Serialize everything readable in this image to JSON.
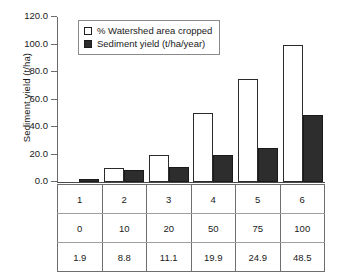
{
  "chart_data": {
    "type": "bar",
    "title": "",
    "xlabel": "",
    "ylabel": "Sediment yield (t/ha)",
    "ylim": [
      0,
      120
    ],
    "yticks": [
      "0.0",
      "20.0",
      "40.0",
      "60.0",
      "80.0",
      "100.0",
      "120.0"
    ],
    "ytick_values": [
      0,
      20,
      40,
      60,
      80,
      100,
      120
    ],
    "grid": false,
    "legend_position": "upper-left-inside",
    "categories": [
      "1",
      "2",
      "3",
      "4",
      "5",
      "6"
    ],
    "series": [
      {
        "name": "% Watershed area cropped",
        "values": [
          0,
          10,
          20,
          50,
          75,
          100
        ],
        "color": "#ffffff",
        "edge_color": "#2b2b2b"
      },
      {
        "name": "Sediment yield (t/ha/year)",
        "values": [
          1.9,
          8.8,
          11.1,
          19.9,
          24.9,
          48.5
        ],
        "color": "#2d2d2d",
        "edge_color": "#1a1a1a"
      }
    ],
    "table": {
      "rows": [
        [
          "1",
          "2",
          "3",
          "4",
          "5",
          "6"
        ],
        [
          "0",
          "10",
          "20",
          "50",
          "75",
          "100"
        ],
        [
          "1.9",
          "8.8",
          "11.1",
          "19.9",
          "24.9",
          "48.5"
        ]
      ]
    }
  }
}
